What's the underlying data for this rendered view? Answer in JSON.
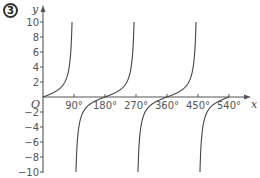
{
  "figure": {
    "badge": "3"
  },
  "chart_data": {
    "type": "line",
    "title": "",
    "function": "y = tan x",
    "xlabel": "x",
    "ylabel": "y",
    "origin_label": "O",
    "xlim": [
      0,
      540
    ],
    "ylim": [
      -10,
      10
    ],
    "x_ticks": [
      90,
      180,
      270,
      360,
      450,
      540
    ],
    "x_tick_labels": [
      "90°",
      "180°",
      "270°",
      "360°",
      "450°",
      "540°"
    ],
    "y_ticks": [
      10,
      8,
      6,
      4,
      2,
      -2,
      -4,
      -6,
      -8,
      -10
    ],
    "y_tick_labels": [
      "10",
      "8",
      "6",
      "4",
      "2",
      "−2",
      "−4",
      "−6",
      "−8",
      "−10"
    ],
    "asymptotes": [
      90,
      270,
      450
    ],
    "zeros": [
      0,
      180,
      360,
      540
    ],
    "grid": false,
    "legend": null,
    "series": [
      {
        "name": "tan x",
        "branches": [
          {
            "x_start": 0,
            "x_end": 84.3
          },
          {
            "x_start": 95.7,
            "x_end": 264.3
          },
          {
            "x_start": 275.7,
            "x_end": 444.3
          },
          {
            "x_start": 455.7,
            "x_end": 540
          }
        ],
        "sample_points": [
          {
            "x": 0,
            "y": 0
          },
          {
            "x": 45,
            "y": 1
          },
          {
            "x": 84.3,
            "y": 10
          },
          {
            "x": 95.7,
            "y": -10
          },
          {
            "x": 135,
            "y": -1
          },
          {
            "x": 180,
            "y": 0
          },
          {
            "x": 225,
            "y": 1
          },
          {
            "x": 264.3,
            "y": 10
          },
          {
            "x": 275.7,
            "y": -10
          },
          {
            "x": 315,
            "y": -1
          },
          {
            "x": 360,
            "y": 0
          },
          {
            "x": 405,
            "y": 1
          },
          {
            "x": 444.3,
            "y": 10
          },
          {
            "x": 455.7,
            "y": -10
          },
          {
            "x": 495,
            "y": -1
          },
          {
            "x": 540,
            "y": 0
          }
        ]
      }
    ]
  },
  "colors": {
    "axis": "#555555",
    "curve": "#444444",
    "text": "#555555"
  }
}
